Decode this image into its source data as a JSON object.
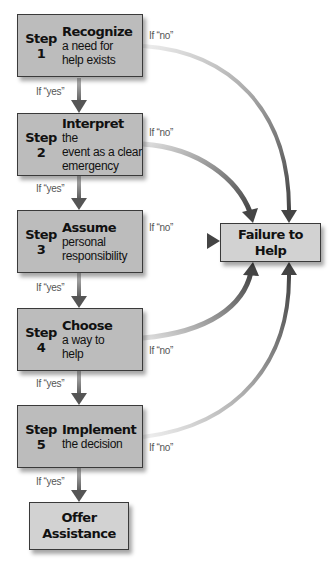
{
  "diagram": {
    "steps": [
      {
        "label": "Step",
        "number": "1",
        "title": "Recognize",
        "title_suffix": "",
        "desc": "a need for help exists"
      },
      {
        "label": "Step",
        "number": "2",
        "title": "Interpret",
        "title_suffix": " the",
        "desc": "event as a clear emergency"
      },
      {
        "label": "Step",
        "number": "3",
        "title": "Assume",
        "title_suffix": "",
        "desc": "personal responsibility"
      },
      {
        "label": "Step",
        "number": "4",
        "title": "Choose",
        "title_suffix": "",
        "desc": "a way to help"
      },
      {
        "label": "Step",
        "number": "5",
        "title": "Implement",
        "title_suffix": "",
        "desc": "the decision"
      }
    ],
    "yes_label": "If “yes”",
    "no_label": "If “no”",
    "failure": "Failure to Help",
    "success_line1": "Offer",
    "success_line2": "Assistance",
    "colors": {
      "box_fill": "#bcbcbc",
      "outcome_fill": "#d2d2d2",
      "border": "#3a3a3a",
      "arrow": "#555555"
    }
  }
}
